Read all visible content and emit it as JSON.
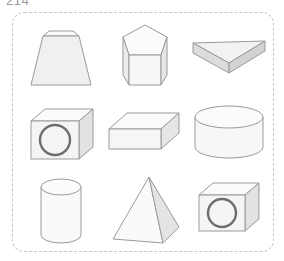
{
  "page": {
    "label": "214",
    "background_color": "#ffffff"
  },
  "panel": {
    "border_style": "dashed",
    "border_color": "#c6c6c6",
    "border_radius_px": 12,
    "fill_color": "#ffffff"
  },
  "palette": {
    "outline": "#9a9a9a",
    "face_light": "#fbfbfb",
    "face_mid": "#f1f1f1",
    "face_dark": "#e3e3e3",
    "face_darker": "#d7d7d7",
    "ring_stroke": "#6e6e6e"
  },
  "grid": {
    "rows": 3,
    "columns": 3,
    "count": 9
  },
  "shapes": [
    {
      "id": "shape-1",
      "row": 1,
      "column": 1,
      "name": "truncated-pyramid",
      "label": "Truncated square pyramid (frustum)"
    },
    {
      "id": "shape-2",
      "row": 1,
      "column": 2,
      "name": "pentagonal-prism",
      "label": "Pentagonal prism"
    },
    {
      "id": "shape-3",
      "row": 1,
      "column": 3,
      "name": "triangular-wedge-prism",
      "label": "Flat triangular prism (wedge)"
    },
    {
      "id": "shape-4",
      "row": 2,
      "column": 1,
      "name": "cube-with-ring",
      "label": "Cube with circular ring on front face"
    },
    {
      "id": "shape-5",
      "row": 2,
      "column": 2,
      "name": "rectangular-box",
      "label": "Rectangular box (cuboid slab)"
    },
    {
      "id": "shape-6",
      "row": 2,
      "column": 3,
      "name": "wide-cylinder",
      "label": "Wide short cylinder"
    },
    {
      "id": "shape-7",
      "row": 3,
      "column": 1,
      "name": "tall-cylinder",
      "label": "Tall narrow cylinder"
    },
    {
      "id": "shape-8",
      "row": 3,
      "column": 2,
      "name": "square-pyramid",
      "label": "Square pyramid"
    },
    {
      "id": "shape-9",
      "row": 3,
      "column": 3,
      "name": "cube-with-ring",
      "label": "Cube with circular ring on front face"
    }
  ]
}
